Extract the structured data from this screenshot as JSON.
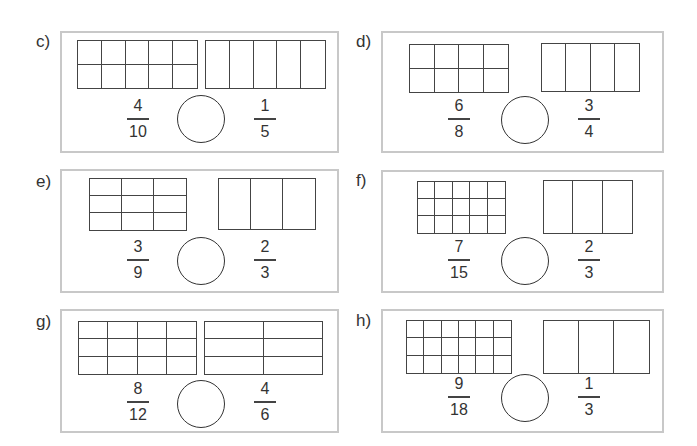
{
  "problems": [
    {
      "label": "c)",
      "frame": {
        "x": 60,
        "y": 31,
        "w": 279,
        "h": 122
      },
      "left_model": {
        "x": 77,
        "y": 40,
        "w": 121,
        "h": 49,
        "cols": 5,
        "rows": 2
      },
      "right_model": {
        "x": 205,
        "y": 40,
        "w": 121,
        "h": 49,
        "cols": 5,
        "rows": 1
      },
      "left_fraction": {
        "numerator": "4",
        "denominator": "10",
        "cx": 138
      },
      "right_fraction": {
        "numerator": "1",
        "denominator": "5",
        "cx": 265
      },
      "circle": {
        "cx": 201,
        "cy": 119,
        "r": 24
      },
      "frac_top": 97,
      "answer": ""
    },
    {
      "label": "d)",
      "frame": {
        "x": 381,
        "y": 31,
        "w": 283,
        "h": 122
      },
      "left_model": {
        "x": 409,
        "y": 44,
        "w": 100,
        "h": 49,
        "cols": 4,
        "rows": 2
      },
      "right_model": {
        "x": 541,
        "y": 43,
        "w": 99,
        "h": 49,
        "cols": 4,
        "rows": 1
      },
      "left_fraction": {
        "numerator": "6",
        "denominator": "8",
        "cx": 459
      },
      "right_fraction": {
        "numerator": "3",
        "denominator": "4",
        "cx": 589
      },
      "circle": {
        "cx": 525,
        "cy": 120,
        "r": 24
      },
      "frac_top": 97,
      "answer": ""
    },
    {
      "label": "e)",
      "frame": {
        "x": 60,
        "y": 169,
        "w": 279,
        "h": 124
      },
      "left_model": {
        "x": 89,
        "y": 178,
        "w": 98,
        "h": 53,
        "cols": 3,
        "rows": 3
      },
      "right_model": {
        "x": 218,
        "y": 178,
        "w": 98,
        "h": 52,
        "cols": 3,
        "rows": 1
      },
      "left_fraction": {
        "numerator": "3",
        "denominator": "9",
        "cx": 138
      },
      "right_fraction": {
        "numerator": "2",
        "denominator": "3",
        "cx": 265
      },
      "circle": {
        "cx": 201,
        "cy": 261,
        "r": 24
      },
      "frac_top": 238,
      "answer": ""
    },
    {
      "label": "f)",
      "frame": {
        "x": 381,
        "y": 170,
        "w": 283,
        "h": 123
      },
      "left_model": {
        "x": 417,
        "y": 181,
        "w": 89,
        "h": 53,
        "cols": 5,
        "rows": 3
      },
      "right_model": {
        "x": 543,
        "y": 180,
        "w": 90,
        "h": 54,
        "cols": 3,
        "rows": 1
      },
      "left_fraction": {
        "numerator": "7",
        "denominator": "15",
        "cx": 459
      },
      "right_fraction": {
        "numerator": "2",
        "denominator": "3",
        "cx": 589
      },
      "circle": {
        "cx": 525,
        "cy": 261,
        "r": 24
      },
      "frac_top": 238,
      "answer": ""
    },
    {
      "label": "g)",
      "frame": {
        "x": 60,
        "y": 309,
        "w": 279,
        "h": 124
      },
      "left_model": {
        "x": 78,
        "y": 321,
        "w": 119,
        "h": 54,
        "cols": 4,
        "rows": 3
      },
      "right_model": {
        "x": 204,
        "y": 321,
        "w": 119,
        "h": 54,
        "cols": 2,
        "rows": 3
      },
      "left_fraction": {
        "numerator": "8",
        "denominator": "12",
        "cx": 138
      },
      "right_fraction": {
        "numerator": "4",
        "denominator": "6",
        "cx": 265
      },
      "circle": {
        "cx": 201,
        "cy": 404,
        "r": 24
      },
      "frac_top": 380,
      "answer": ""
    },
    {
      "label": "h)",
      "frame": {
        "x": 381,
        "y": 309,
        "w": 283,
        "h": 124
      },
      "left_model": {
        "x": 406,
        "y": 320,
        "w": 106,
        "h": 54,
        "cols": 6,
        "rows": 3
      },
      "right_model": {
        "x": 543,
        "y": 320,
        "w": 107,
        "h": 54,
        "cols": 3,
        "rows": 1
      },
      "left_fraction": {
        "numerator": "9",
        "denominator": "18",
        "cx": 459
      },
      "right_fraction": {
        "numerator": "1",
        "denominator": "3",
        "cx": 589
      },
      "circle": {
        "cx": 525,
        "cy": 398,
        "r": 24
      },
      "frac_top": 375,
      "answer": ""
    }
  ],
  "label_positions": [
    {
      "x": 36,
      "y": 33
    },
    {
      "x": 356,
      "y": 33
    },
    {
      "x": 36,
      "y": 173
    },
    {
      "x": 356,
      "y": 172
    },
    {
      "x": 36,
      "y": 313
    },
    {
      "x": 356,
      "y": 312
    }
  ],
  "colors": {
    "frame_border": "#c8c8c8",
    "grid_line": "#444444",
    "text": "#333333",
    "circle_stroke": "#333333"
  }
}
